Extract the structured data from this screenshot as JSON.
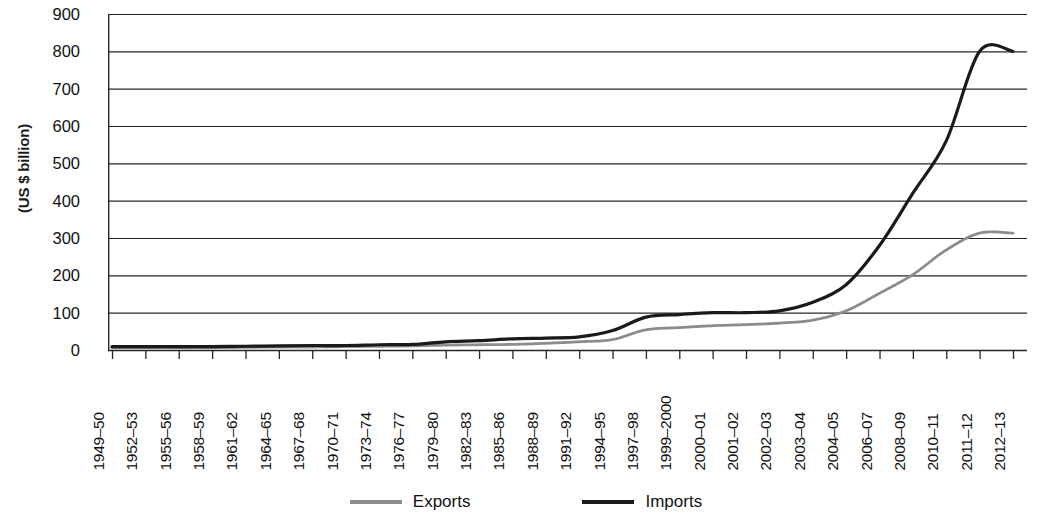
{
  "chart_data": {
    "type": "line",
    "title": "",
    "xlabel": "",
    "ylabel": "(US $ billion)",
    "ylim": [
      0,
      900
    ],
    "yticks": [
      0,
      100,
      200,
      300,
      400,
      500,
      600,
      700,
      800,
      900
    ],
    "grid": true,
    "legend_position": "bottom",
    "categories": [
      "1949–50",
      "1952–53",
      "1955–56",
      "1958–59",
      "1961–62",
      "1964–65",
      "1967–68",
      "1970–71",
      "1973–74",
      "1976–77",
      "1979–80",
      "1982–83",
      "1985–86",
      "1988–89",
      "1991–92",
      "1994–95",
      "1997–98",
      "1999–2000",
      "2000–01",
      "2001–02",
      "2002–03",
      "2003–04",
      "2004–05",
      "2006–07",
      "2008–09",
      "2010–11",
      "2011–12",
      "2012–13"
    ],
    "series": [
      {
        "name": "Exports",
        "color": "#8c8c8c",
        "values": [
          6,
          6,
          6,
          6,
          7,
          8,
          8,
          9,
          10,
          11,
          13,
          14,
          15,
          18,
          22,
          28,
          54,
          60,
          65,
          68,
          72,
          80,
          105,
          152,
          202,
          268,
          313,
          313
        ]
      },
      {
        "name": "Imports",
        "color": "#1a1a1a",
        "values": [
          9,
          9,
          9,
          9,
          10,
          11,
          12,
          12,
          14,
          15,
          22,
          25,
          30,
          32,
          35,
          52,
          88,
          95,
          100,
          100,
          105,
          128,
          175,
          280,
          420,
          560,
          800,
          800
        ]
      }
    ]
  },
  "legend": {
    "entries": [
      {
        "label": "Exports",
        "swatch": "exports-line-swatch"
      },
      {
        "label": "Imports",
        "swatch": "imports-line-swatch"
      }
    ]
  }
}
